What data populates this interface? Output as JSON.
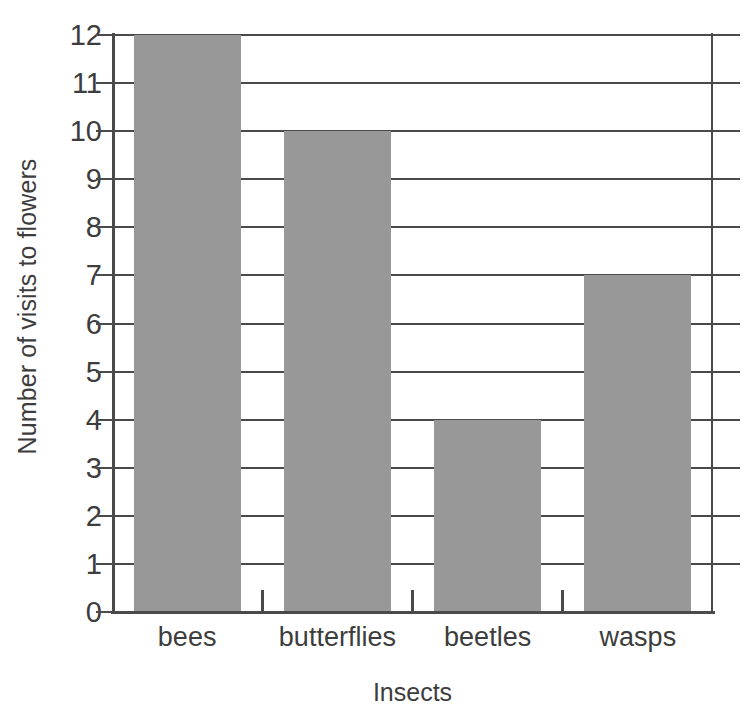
{
  "chart_data": {
    "type": "bar",
    "title": "",
    "subtitle": "",
    "categories": [
      "bees",
      "butterflies",
      "beetles",
      "wasps"
    ],
    "values": [
      12,
      10,
      4,
      7
    ],
    "xlabel": "Insects",
    "ylabel": "Number of visits to flowers",
    "ylim": [
      0,
      12
    ],
    "ytick_labels": [
      "12",
      "11",
      "10",
      "9",
      "8",
      "7",
      "6",
      "5",
      "4",
      "3",
      "2",
      "1",
      "0"
    ],
    "ytick_values": [
      12,
      11,
      10,
      9,
      8,
      7,
      6,
      5,
      4,
      3,
      2,
      1,
      0
    ],
    "ytick_step": 1,
    "grid": true,
    "grid_axis": "y",
    "legend": false,
    "legend_position": "none",
    "orientation": "vertical",
    "bar_color": "#989898",
    "axis_color": "#4a4a4a",
    "gridline_color": "#4a4a4a",
    "text_color": "#3d3d3d",
    "background_color": "#ffffff",
    "annotations": []
  }
}
